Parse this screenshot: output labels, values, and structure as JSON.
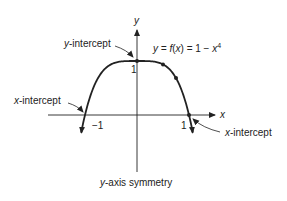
{
  "function": {
    "equation_prefix": "y = ",
    "equation_f": "f",
    "equation_mid": "(",
    "equation_x": "x",
    "equation_rest": ") = 1 − ",
    "equation_x2": "x",
    "equation_exp": "4",
    "expression": "1 - x^4",
    "domain_shown": [
      -1.07,
      1.07
    ],
    "marked_points": [
      [
        -1,
        0
      ],
      [
        0,
        1
      ],
      [
        0.5,
        0.9375
      ],
      [
        0.75,
        0.684
      ],
      [
        1,
        0
      ]
    ]
  },
  "axes": {
    "x_label": "x",
    "y_label": "y",
    "tick_neg1": "−1",
    "tick_pos1": "1",
    "tick_y1": "1"
  },
  "annotations": {
    "y_intercept": {
      "var": "y",
      "rest": "-intercept"
    },
    "x_intercept_left": {
      "var": "x",
      "rest": "-intercept"
    },
    "x_intercept_right": {
      "var": "x",
      "rest": "-intercept"
    },
    "symmetry": {
      "var": "y",
      "rest": "-axis symmetry"
    }
  },
  "colors": {
    "ink": "#222222"
  }
}
